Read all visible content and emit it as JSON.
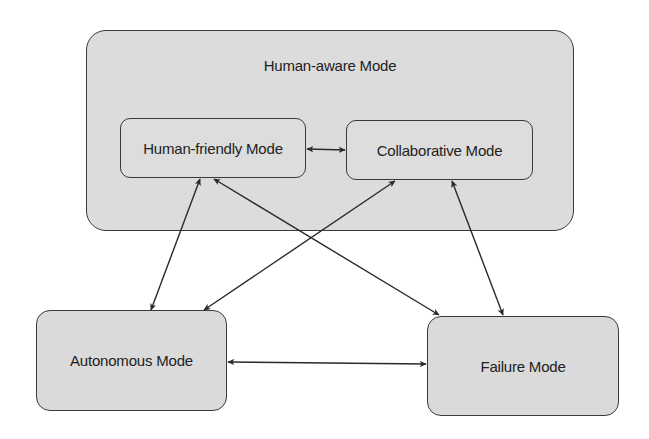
{
  "diagram": {
    "container": {
      "label": "Human-aware Mode",
      "children": [
        "Human-friendly Mode",
        "Collaborative Mode"
      ]
    },
    "nodes": [
      {
        "id": "human-friendly",
        "label": "Human-friendly Mode"
      },
      {
        "id": "collaborative",
        "label": "Collaborative Mode"
      },
      {
        "id": "autonomous",
        "label": "Autonomous Mode"
      },
      {
        "id": "failure",
        "label": "Failure Mode"
      }
    ],
    "edges": [
      {
        "from": "Human-friendly Mode",
        "to": "Collaborative Mode",
        "direction": "bidirectional"
      },
      {
        "from": "Human-friendly Mode",
        "to": "Autonomous Mode",
        "direction": "bidirectional"
      },
      {
        "from": "Human-friendly Mode",
        "to": "Failure Mode",
        "direction": "bidirectional"
      },
      {
        "from": "Collaborative Mode",
        "to": "Autonomous Mode",
        "direction": "bidirectional"
      },
      {
        "from": "Collaborative Mode",
        "to": "Failure Mode",
        "direction": "bidirectional"
      },
      {
        "from": "Autonomous Mode",
        "to": "Failure Mode",
        "direction": "bidirectional"
      }
    ],
    "colors": {
      "box_fill": "#dadada",
      "box_stroke": "#3a3a3a",
      "arrow": "#2a2a2a",
      "background": "#ffffff"
    }
  }
}
